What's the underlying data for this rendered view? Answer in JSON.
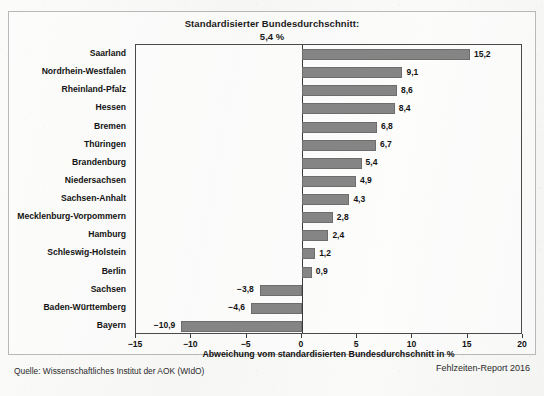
{
  "figure": {
    "title": "Standardisierter Bundesdurchschnitt:",
    "subtitle": "5,4 %",
    "source_label": "Quelle: Wissenschaftliches Institut der AOK (WIdO)",
    "report_label": "Fehlzeiten-Report 2016",
    "bar_color": "#858585",
    "axis_color": "#3a3a3a",
    "frame_color": "#b8b8b8"
  },
  "chart_data": {
    "type": "bar",
    "orientation": "horizontal",
    "title": "Standardisierter Bundesdurchschnitt: 5,4 %",
    "xlabel": "Abweichung vom standardisierten Bundesdurchschnitt in %",
    "ylabel": "",
    "xlim": [
      -15,
      20
    ],
    "xticks": [
      -15,
      -10,
      -5,
      0,
      5,
      10,
      15,
      20
    ],
    "xtick_labels": [
      "−15",
      "−10",
      "−5",
      "0",
      "5",
      "10",
      "15",
      "20"
    ],
    "grid": false,
    "legend": null,
    "categories": [
      "Saarland",
      "Nordrhein-Westfalen",
      "Rheinland-Pfalz",
      "Hessen",
      "Bremen",
      "Thüringen",
      "Brandenburg",
      "Niedersachsen",
      "Sachsen-Anhalt",
      "Mecklenburg-Vorpommern",
      "Hamburg",
      "Schleswig-Holstein",
      "Berlin",
      "Sachsen",
      "Baden-Württemberg",
      "Bayern"
    ],
    "values": [
      15.2,
      9.1,
      8.6,
      8.4,
      6.8,
      6.7,
      5.4,
      4.9,
      4.3,
      2.8,
      2.4,
      1.2,
      0.9,
      -3.8,
      -4.6,
      -10.9
    ],
    "value_labels": [
      "15,2",
      "9,1",
      "8,6",
      "8,4",
      "6,8",
      "6,7",
      "5,4",
      "4,9",
      "4,3",
      "2,8",
      "2,4",
      "1,2",
      "0,9",
      "−3,8",
      "−4,6",
      "−10,9"
    ]
  }
}
